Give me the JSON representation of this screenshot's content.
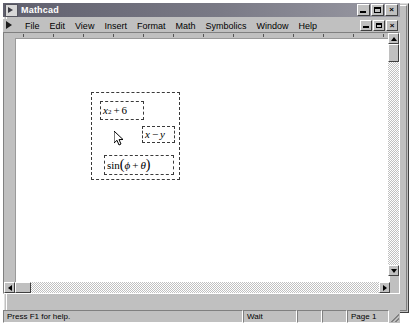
{
  "window": {
    "title": "Mathcad",
    "app_icon": "mathcad-icon",
    "controls": {
      "minimize": "minimize-icon",
      "maximize": "maximize-icon",
      "close": "close-icon",
      "close_label": "×"
    }
  },
  "menu": {
    "document_icon": "document-control-icon",
    "items": [
      {
        "label": "File",
        "accel": "F"
      },
      {
        "label": "Edit",
        "accel": "E"
      },
      {
        "label": "View",
        "accel": "V"
      },
      {
        "label": "Insert",
        "accel": "I"
      },
      {
        "label": "Format",
        "accel": "o"
      },
      {
        "label": "Math",
        "accel": "M"
      },
      {
        "label": "Symbolics",
        "accel": "S"
      },
      {
        "label": "Window",
        "accel": "W"
      },
      {
        "label": "Help",
        "accel": "H"
      }
    ],
    "doc_controls": {
      "minimize": "doc-minimize-icon",
      "restore": "doc-restore-icon",
      "close": "doc-close-icon",
      "close_label": "×"
    }
  },
  "document": {
    "selection_marquee": "selection-marquee",
    "regions": [
      {
        "id": "region-1",
        "name": "math-region-quadratic",
        "plain_text": "x^2 + 6",
        "base": "x",
        "exponent": "2",
        "operator": "+",
        "operand": "6"
      },
      {
        "id": "region-2",
        "name": "math-region-difference",
        "plain_text": "x − y",
        "left": "x",
        "operator": "−",
        "right": "y"
      },
      {
        "id": "region-3",
        "name": "math-region-sine",
        "plain_text": "sin(ϕ + θ)",
        "function": "sin",
        "open_paren": "(",
        "arg_left": "ϕ",
        "operator": "+",
        "arg_right": "θ",
        "close_paren": ")"
      }
    ]
  },
  "scrollbars": {
    "vertical": {
      "up": "scroll-up-arrow",
      "down": "scroll-down-arrow"
    },
    "horizontal": {
      "left": "scroll-left-arrow",
      "right": "scroll-right-arrow"
    }
  },
  "status_bar": {
    "help_text": "Press F1 for help.",
    "message": "Wait",
    "cell_a": "",
    "cell_b": "",
    "page": "Page 1"
  },
  "colors": {
    "desktop": "#c0c0c0",
    "page": "#ffffff",
    "title_bar": "#6b6b78",
    "dash": "#3a3a3a"
  }
}
